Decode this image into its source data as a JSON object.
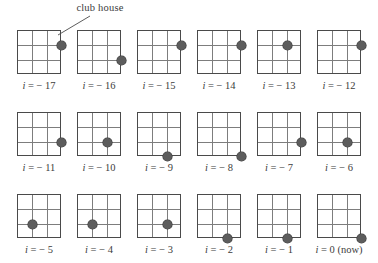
{
  "figure": {
    "annotation": {
      "label": "club house",
      "points_to_panel": "i = -17"
    },
    "grid_layout": {
      "columns": 6,
      "rows": 3,
      "board_cells": 3,
      "board_lines": 4
    },
    "colors": {
      "board_border": "#4a4a4a",
      "grid_line": "#7d7d7d",
      "marker_fill": "#5d5d5d",
      "marker_stroke": "#3b3b3b",
      "text": "#3c3c3c",
      "background": "#ffffff"
    },
    "panels": [
      {
        "caption": "i = − 17",
        "index": -17,
        "marker": {
          "col": 3,
          "row": 1,
          "arrow": "down",
          "has_arrow": true
        }
      },
      {
        "caption": "i = − 16",
        "index": -16,
        "marker": {
          "col": 3,
          "row": 2,
          "arrow": "down",
          "has_arrow": true
        }
      },
      {
        "caption": "i = − 15",
        "index": -15,
        "marker": {
          "col": 3,
          "row": 1,
          "arrow": "down",
          "has_arrow": true
        }
      },
      {
        "caption": "i = − 14",
        "index": -14,
        "marker": {
          "col": 3,
          "row": 1,
          "arrow": "left",
          "has_arrow": true
        }
      },
      {
        "caption": "i = − 13",
        "index": -13,
        "marker": {
          "col": 2,
          "row": 1,
          "arrow": "left",
          "has_arrow": true
        }
      },
      {
        "caption": "i = − 12",
        "index": -12,
        "marker": {
          "col": 3,
          "row": 1,
          "arrow": "down",
          "has_arrow": true
        }
      },
      {
        "caption": "i = − 11",
        "index": -11,
        "marker": {
          "col": 3,
          "row": 2,
          "arrow": "left",
          "has_arrow": true
        }
      },
      {
        "caption": "i = − 10",
        "index": -10,
        "marker": {
          "col": 2,
          "row": 2,
          "arrow": "down",
          "has_arrow": true
        }
      },
      {
        "caption": "i = − 9",
        "index": -9,
        "marker": {
          "col": 2,
          "row": 3,
          "arrow": "left",
          "has_arrow": true
        }
      },
      {
        "caption": "i = − 8",
        "index": -8,
        "marker": {
          "col": 3,
          "row": 3,
          "arrow": "down",
          "has_arrow": true
        }
      },
      {
        "caption": "i = − 7",
        "index": -7,
        "marker": {
          "col": 3,
          "row": 2,
          "arrow": "left",
          "has_arrow": true
        }
      },
      {
        "caption": "i = − 6",
        "index": -6,
        "marker": {
          "col": 2,
          "row": 2,
          "arrow": "left",
          "has_arrow": true
        }
      },
      {
        "caption": "i = − 5",
        "index": -5,
        "marker": {
          "col": 1,
          "row": 2,
          "arrow": "left",
          "has_arrow": true
        }
      },
      {
        "caption": "i = − 4",
        "index": -4,
        "marker": {
          "col": 1,
          "row": 2,
          "arrow": "left",
          "has_arrow": true
        }
      },
      {
        "caption": "i = − 3",
        "index": -3,
        "marker": {
          "col": 2,
          "row": 2,
          "arrow": "down",
          "has_arrow": true
        }
      },
      {
        "caption": "i = − 2",
        "index": -2,
        "marker": {
          "col": 2,
          "row": 3,
          "arrow": "down",
          "has_arrow": true
        }
      },
      {
        "caption": "i = − 1",
        "index": -1,
        "marker": {
          "col": 2,
          "row": 3,
          "arrow": "left",
          "has_arrow": true
        }
      },
      {
        "caption": "i = 0 (now)",
        "index": 0,
        "marker": {
          "col": 3,
          "row": 3,
          "arrow": "none",
          "has_arrow": false
        }
      }
    ]
  }
}
